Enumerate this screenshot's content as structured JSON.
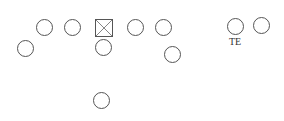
{
  "diagram": {
    "type": "football-formation",
    "stroke_color": "#555555",
    "players": [
      {
        "id": "left-guard-outer",
        "shape": "circle",
        "x": 45,
        "y": 28
      },
      {
        "id": "left-guard",
        "shape": "circle",
        "x": 73,
        "y": 28
      },
      {
        "id": "center",
        "shape": "square-x",
        "x": 104,
        "y": 28
      },
      {
        "id": "right-guard",
        "shape": "circle",
        "x": 136,
        "y": 28
      },
      {
        "id": "right-tackle",
        "shape": "circle",
        "x": 164,
        "y": 28
      },
      {
        "id": "wing-left",
        "shape": "circle",
        "x": 26,
        "y": 49
      },
      {
        "id": "quarterback",
        "shape": "circle",
        "x": 104,
        "y": 48
      },
      {
        "id": "back-right",
        "shape": "circle",
        "x": 173,
        "y": 55
      },
      {
        "id": "tight-end",
        "shape": "circle",
        "x": 236,
        "y": 27,
        "label": "TE"
      },
      {
        "id": "wide-right",
        "shape": "circle",
        "x": 262,
        "y": 26
      },
      {
        "id": "deep-back",
        "shape": "circle",
        "x": 102,
        "y": 101
      }
    ],
    "labels": {
      "te": "TE"
    }
  }
}
